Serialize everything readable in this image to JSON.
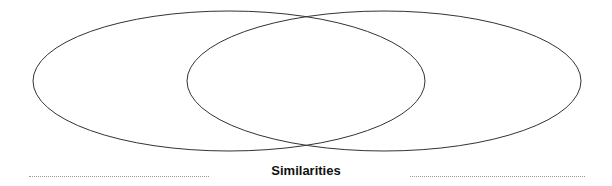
{
  "diagram": {
    "type": "venn",
    "sets": [
      {
        "name": "left-set",
        "label": ""
      },
      {
        "name": "right-set",
        "label": ""
      }
    ],
    "overlap_label": "Similarities",
    "stroke_color": "#333333"
  }
}
